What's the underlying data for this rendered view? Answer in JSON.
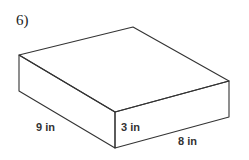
{
  "problem": {
    "number": "6)"
  },
  "figure": {
    "shape": "rectangular prism",
    "dimensions": {
      "length": "9 in",
      "height": "3 in",
      "width": "8 in"
    },
    "stroke_color": "#333333"
  }
}
